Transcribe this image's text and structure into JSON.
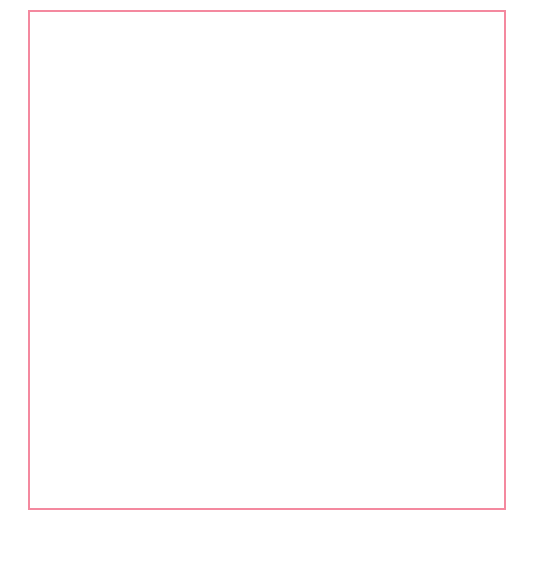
{
  "figure": {
    "border_color": "#f4899f",
    "background": "#ffffff",
    "signature": "HR"
  },
  "annotations": {
    "region_label": "alte BRD",
    "series_label_total": "Deutschland gesamt",
    "series_label_total_line1": "Deutschland",
    "series_label_total_line2": "gesamt",
    "series_label_male": "männlich",
    "series_label_female": "weiblich"
  },
  "chart_data": {
    "type": "line",
    "title": "",
    "subtitle": "",
    "xlabel": "",
    "ylabel": "",
    "xlim": [
      1976.2,
      2000.6
    ],
    "ylim": [
      0,
      17000
    ],
    "grid": false,
    "legend_position": "inline-annotations",
    "y_ticks": [
      0,
      2000,
      4000,
      6000,
      8000,
      10000,
      12000,
      14000,
      16000
    ],
    "y_tick_labels": [
      "0",
      "2000",
      "4000",
      "6000",
      "8000",
      "10000",
      "12000",
      "14000",
      "16000"
    ],
    "x_ticks": [
      1980,
      1985,
      1990,
      1995,
      2000
    ],
    "x_tick_labels": [
      "1980",
      "1985",
      "1990",
      "1995",
      "2000"
    ],
    "x_minor_tick_step": 1,
    "shaded_region": {
      "label": "alte BRD",
      "x_start": 1976.2,
      "x_end": 1987.0,
      "color": "#f7cbdd"
    },
    "shaded_region_light": {
      "x_start": 1987.0,
      "x_end": 2000.6,
      "color": "#fbeaf2"
    },
    "series": [
      {
        "name": "Deutschland gesamt",
        "color": "#e8456e",
        "marker": "circle-outline",
        "line_style": "dotted",
        "x": [
          1977,
          1978,
          1979,
          1980,
          1981,
          1982,
          1983,
          1984,
          1985,
          1986,
          1987,
          1988,
          1989,
          1990,
          1991,
          1992,
          1993,
          1994,
          1995,
          1996,
          1997,
          1998,
          1999,
          2000
        ],
        "values": [
          6400,
          6550,
          6750,
          6950,
          7150,
          7300,
          7450,
          7550,
          7700,
          7900,
          8150,
          8400,
          8900,
          11200,
          11600,
          11900,
          12300,
          12800,
          13200,
          13600,
          13950,
          14250,
          14450,
          14600
        ]
      },
      {
        "name": "männlich",
        "color": "#111111",
        "marker": "circle-filled",
        "line_style": "solid",
        "x": [
          1977,
          1978,
          1979,
          1980,
          1981,
          1982,
          1983,
          1984,
          1985,
          1986,
          1987,
          1988,
          1989,
          1994,
          1995,
          1996,
          1997,
          1998,
          1999,
          2000
        ],
        "values": [
          5450,
          5550,
          5700,
          5850,
          6000,
          6150,
          6250,
          6300,
          6400,
          6500,
          6600,
          6650,
          6900,
          8850,
          8800,
          8850,
          8800,
          8700,
          8550,
          8450
        ]
      },
      {
        "name": "weiblich",
        "color": "#f2376b",
        "marker": "circle-filled",
        "line_style": "solid",
        "x": [
          1977,
          1978,
          1979,
          1980,
          1981,
          1982,
          1983,
          1984,
          1985,
          1986,
          1987,
          1988,
          1989,
          1994,
          1995,
          1996,
          1997,
          1998,
          1999,
          2000
        ],
        "values": [
          950,
          960,
          980,
          1020,
          1080,
          1120,
          1180,
          1230,
          1300,
          1380,
          1450,
          1550,
          1800,
          4100,
          4450,
          4750,
          5000,
          5250,
          5550,
          5900
        ]
      }
    ]
  }
}
